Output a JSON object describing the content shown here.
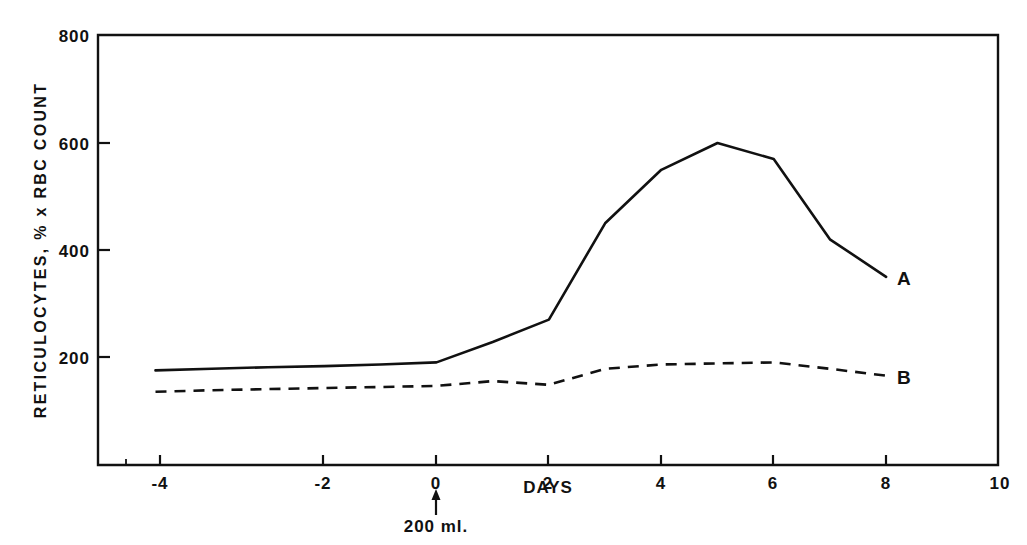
{
  "chart_data": {
    "type": "line",
    "title": "",
    "xlabel": "DAYS",
    "ylabel": "RETICULOCYTES, % x RBC COUNT",
    "xlim": [
      -6.1,
      10.0
    ],
    "ylim": [
      -2,
      800
    ],
    "grid": false,
    "legend_position": "inline-right-end",
    "xticks": [
      -4,
      -2,
      0,
      2,
      4,
      6,
      8,
      10
    ],
    "xticklabels": [
      "-4",
      "-2",
      "0",
      "2",
      "4",
      "6",
      "8",
      "10"
    ],
    "minor_xticks": [
      -5,
      -3,
      -1,
      1,
      3,
      5,
      7,
      9
    ],
    "yticks": [
      200,
      400,
      600,
      800
    ],
    "yticklabels": [
      "200",
      "400",
      "600",
      "800"
    ],
    "annotations": [
      {
        "name": "transfusion-marker",
        "text": "200 ml.",
        "x": 0,
        "arrow": "up",
        "description": "Upward arrow at day 0 marking a 200 ml transfusion"
      }
    ],
    "series": [
      {
        "name": "A",
        "label": "A",
        "style": "solid",
        "color": "#111111",
        "x": [
          -5,
          -4,
          -3,
          -2,
          -1,
          0,
          1,
          2,
          3,
          4,
          5,
          6,
          7,
          8
        ],
        "values": [
          175,
          178,
          181,
          183,
          186,
          190,
          228,
          270,
          450,
          550,
          600,
          570,
          420,
          350
        ]
      },
      {
        "name": "B",
        "label": "B",
        "style": "dashed",
        "color": "#111111",
        "x": [
          -5,
          -4,
          -3,
          -2,
          -1,
          0,
          1,
          2,
          3,
          4,
          5,
          6,
          7,
          8
        ],
        "values": [
          135,
          138,
          140,
          142,
          144,
          146,
          155,
          148,
          178,
          186,
          188,
          190,
          178,
          165
        ]
      }
    ]
  },
  "axes": {
    "y_axis_title": "RETICULOCYTES, % x RBC COUNT",
    "x_axis_title": "DAYS"
  },
  "series_labels": {
    "a": "A",
    "b": "B"
  },
  "annotation": {
    "transfusion_text": "200 ml."
  },
  "colors": {
    "ink": "#111111",
    "background": "#ffffff"
  }
}
